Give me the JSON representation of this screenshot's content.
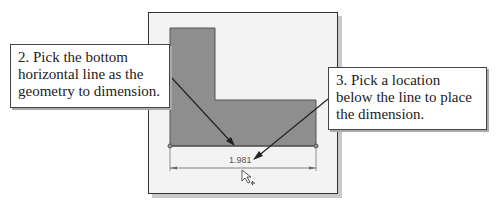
{
  "callouts": [
    {
      "label": "2. Pick the bottom horizontal line as the geometry to dimension."
    },
    {
      "label": "3. Pick a location below the line to place the dimension."
    }
  ],
  "sketch": {
    "dimension_value": "1.981",
    "colors": {
      "shape_fill": "#8e8e8e",
      "background": "#f3f3f3",
      "dimension_line": "#555555"
    }
  },
  "icons": {
    "cursor": "smart-dimension-cursor-icon"
  }
}
